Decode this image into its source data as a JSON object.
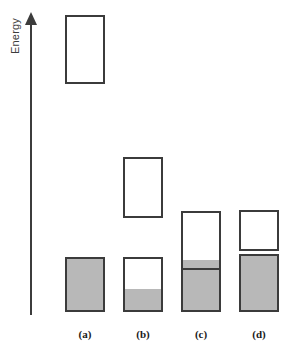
{
  "figure": {
    "axis": {
      "label": "Energy",
      "direction": "up",
      "arrow_icon": "arrow-up-icon"
    },
    "colors": {
      "filled_band": "#b8b8b8",
      "empty_band": "#ffffff",
      "band_outline": "#3b3b3b",
      "axis": "#3c3c3c",
      "label_text": "#1a1a1a"
    },
    "columns": [
      {
        "key": "a",
        "label": "(a)",
        "x": 65,
        "width": 40,
        "bands": [
          {
            "name": "conduction-band",
            "top": 15,
            "height": 69,
            "fill_fraction": 0.0,
            "fill_state": "empty"
          },
          {
            "name": "valence-band",
            "top": 257,
            "height": 55,
            "fill_fraction": 1.0,
            "fill_state": "full"
          }
        ]
      },
      {
        "key": "b",
        "label": "(b)",
        "x": 123,
        "width": 40,
        "bands": [
          {
            "name": "conduction-band",
            "top": 157,
            "height": 61,
            "fill_fraction": 0.0,
            "fill_state": "empty"
          },
          {
            "name": "valence-band",
            "top": 257,
            "height": 55,
            "fill_fraction": 0.42,
            "fill_state": "partial"
          }
        ]
      },
      {
        "key": "c",
        "label": "(c)",
        "x": 181,
        "width": 40,
        "bands": [
          {
            "name": "partially-filled-band",
            "top": 211,
            "height": 101,
            "fill_fraction": 0.4,
            "fill_state": "partial-with-sublevel",
            "sub_band": {
              "name": "sub-level-band",
              "top_offset": 49,
              "height": 8
            },
            "sub_line": {
              "name": "fermi-level-line",
              "top_offset": 57
            }
          }
        ]
      },
      {
        "key": "d",
        "label": "(d)",
        "x": 239,
        "width": 40,
        "bands": [
          {
            "name": "upper-overlapping-band",
            "top": 210,
            "height": 41,
            "fill_fraction": 0.0,
            "fill_state": "empty"
          },
          {
            "name": "lower-overlapping-band",
            "top": 254,
            "height": 58,
            "fill_fraction": 1.0,
            "fill_state": "full"
          }
        ]
      }
    ]
  }
}
